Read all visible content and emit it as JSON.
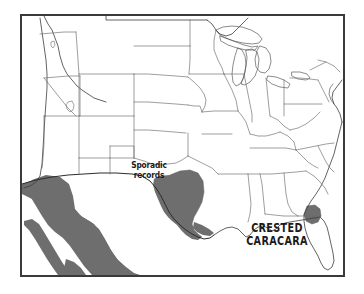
{
  "figure": {
    "kind": "range-map",
    "background_color": "#ffffff",
    "frame_color": "#3a3a3a",
    "outline_color": "#5a5a5a",
    "coast_color": "#3c3c3c",
    "range_fill_color": "#6e6e6e",
    "label_color": "#1b1b1b"
  },
  "labels": {
    "species": "CRESTED\nCARACARA",
    "species_line_1": "CRESTED",
    "species_line_2": "CARACARA",
    "sporadic": "Sporadic\nrecords",
    "sporadic_line_1": "Sporadic",
    "sporadic_line_2": "records"
  },
  "legend": {
    "range_meaning": "shaded gray = resident breeding range",
    "sporadic_meaning": "Sporadic records"
  },
  "regions": [
    {
      "name": "south-texas-range",
      "fill": "#6e6e6e",
      "description": "Shaded resident range across south Texas and the lower Gulf coast"
    },
    {
      "name": "mexico-mainland-range",
      "fill": "#6e6e6e",
      "description": "Shaded resident range through northern and western mainland Mexico"
    },
    {
      "name": "baja-california-range",
      "fill": "#6e6e6e",
      "description": "Shaded resident range down the Baja California peninsula"
    },
    {
      "name": "central-florida-range",
      "fill": "#6e6e6e",
      "description": "Small isolated shaded population in central Florida"
    }
  ]
}
